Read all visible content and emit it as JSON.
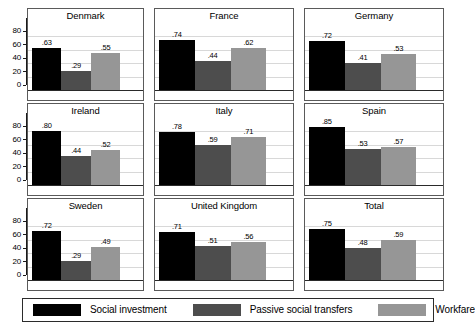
{
  "chart_data": {
    "type": "bar",
    "title": "",
    "subtitle": "",
    "xlabel": "",
    "ylabel": "",
    "ylim": [
      0,
      100
    ],
    "yticks": [
      0,
      20,
      40,
      60,
      80
    ],
    "grid": true,
    "legend_position": "bottom",
    "layout": "small-multiples 3x3",
    "series_names": [
      "Social investment",
      "Passive social transfers",
      "Workfare"
    ],
    "series_colors": [
      "#000000",
      "#4d4d4d",
      "#969696"
    ],
    "panels": [
      {
        "title": "Denmark",
        "values": [
          63,
          29,
          55
        ],
        "labels": [
          ".63",
          ".29",
          ".55"
        ]
      },
      {
        "title": "France",
        "values": [
          74,
          44,
          62
        ],
        "labels": [
          ".74",
          ".44",
          ".62"
        ]
      },
      {
        "title": "Germany",
        "values": [
          72,
          41,
          53
        ],
        "labels": [
          ".72",
          ".41",
          ".53"
        ]
      },
      {
        "title": "Ireland",
        "values": [
          80,
          44,
          52
        ],
        "labels": [
          ".80",
          ".44",
          ".52"
        ]
      },
      {
        "title": "Italy",
        "values": [
          78,
          59,
          71
        ],
        "labels": [
          ".78",
          ".59",
          ".71"
        ]
      },
      {
        "title": "Spain",
        "values": [
          85,
          53,
          57
        ],
        "labels": [
          ".85",
          ".53",
          ".57"
        ]
      },
      {
        "title": "Sweden",
        "values": [
          72,
          29,
          49
        ],
        "labels": [
          ".72",
          ".29",
          ".49"
        ]
      },
      {
        "title": "United Kingdom",
        "values": [
          71,
          51,
          56
        ],
        "labels": [
          ".71",
          ".51",
          ".56"
        ]
      },
      {
        "title": "Total",
        "values": [
          75,
          48,
          59
        ],
        "labels": [
          ".75",
          ".48",
          ".59"
        ]
      }
    ]
  },
  "legend": {
    "entries": [
      {
        "label": "Social investment",
        "color": "#000000"
      },
      {
        "label": "Passive social transfers",
        "color": "#4d4d4d"
      },
      {
        "label": "Workfare",
        "color": "#969696"
      }
    ]
  }
}
